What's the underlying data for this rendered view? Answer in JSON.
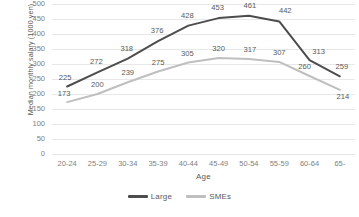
{
  "chart_data": {
    "type": "line",
    "title": "",
    "xlabel": "Age",
    "ylabel": "Median monthly salary (1000 yen)",
    "categories": [
      "20-24",
      "25-29",
      "30-34",
      "35-39",
      "40-44",
      "45-49",
      "50-54",
      "55-59",
      "60-64",
      "65-"
    ],
    "series": [
      {
        "name": "Large",
        "color": "#4d4d4d",
        "values": [
          225,
          272,
          318,
          376,
          428,
          453,
          461,
          442,
          313,
          259
        ]
      },
      {
        "name": "SMEs",
        "color": "#bfbfbf",
        "values": [
          173,
          200,
          239,
          275,
          305,
          320,
          317,
          307,
          260,
          214
        ]
      }
    ],
    "ylim": [
      0,
      500
    ],
    "ytick_step": 50,
    "yticks": [
      "500",
      "450",
      "400",
      "350",
      "300",
      "250",
      "200",
      "150",
      "100",
      "50",
      "0"
    ],
    "grid": true,
    "legend_position": "bottom",
    "label_offsets": {
      "Large": [
        {
          "dx": -2,
          "dy": -5
        },
        {
          "dx": -1,
          "dy": -6
        },
        {
          "dx": -1,
          "dy": -6
        },
        {
          "dx": -1,
          "dy": -6
        },
        {
          "dx": -1,
          "dy": -6
        },
        {
          "dx": -1,
          "dy": -6
        },
        {
          "dx": 1,
          "dy": -6
        },
        {
          "dx": 6,
          "dy": -6
        },
        {
          "dx": 9,
          "dy": -4
        },
        {
          "dx": 2,
          "dy": -5
        }
      ],
      "SMEs": [
        {
          "dx": -3,
          "dy": -4
        },
        {
          "dx": 0,
          "dy": -5
        },
        {
          "dx": 0,
          "dy": -5
        },
        {
          "dx": 0,
          "dy": -5
        },
        {
          "dx": -1,
          "dy": -5
        },
        {
          "dx": 0,
          "dy": -5
        },
        {
          "dx": 1,
          "dy": -5
        },
        {
          "dx": 0,
          "dy": -5
        },
        {
          "dx": -5,
          "dy": -5
        },
        {
          "dx": 3,
          "dy": 11
        }
      ]
    }
  },
  "legend": {
    "items": [
      {
        "label": "Large",
        "color": "#4d4d4d"
      },
      {
        "label": "SMEs",
        "color": "#bfbfbf"
      }
    ]
  }
}
